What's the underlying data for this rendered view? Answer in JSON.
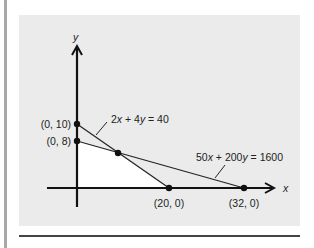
{
  "diagram": {
    "axes": {
      "x_label": "x",
      "y_label": "y"
    },
    "constraints": [
      {
        "equation": "2x + 4y = 40",
        "label_parts": [
          "2",
          "x",
          " + 4",
          "y",
          " = 40"
        ]
      },
      {
        "equation": "50x + 200y = 1600",
        "label_parts": [
          "50",
          "x",
          " + 200",
          "y",
          " = 1600"
        ]
      }
    ],
    "points": [
      {
        "label": "(0, 10)",
        "x": 0,
        "y": 10
      },
      {
        "label": "(0, 8)",
        "x": 0,
        "y": 8
      },
      {
        "label": "(20, 0)",
        "x": 20,
        "y": 0
      },
      {
        "label": "(32, 0)",
        "x": 32,
        "y": 0
      },
      {
        "label": "",
        "x": 8,
        "y": 6
      }
    ],
    "colors": {
      "panel": "#ebebeb",
      "feasible_region": "#ffffff",
      "ink": "#111111",
      "rule": "#a8a8a8"
    }
  }
}
